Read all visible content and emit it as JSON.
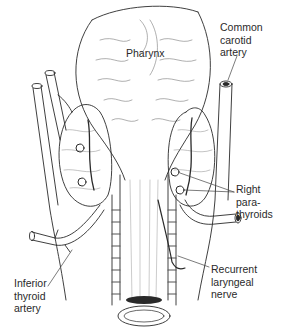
{
  "figure": {
    "colors": {
      "line": "#2a2a2a",
      "shade": "#8a8a8a",
      "background": "#ffffff"
    }
  },
  "labels": {
    "pharynx": {
      "lines": [
        "Pharynx"
      ]
    },
    "common_carotid_artery": {
      "lines": [
        "Common",
        "carotid",
        "artery"
      ]
    },
    "right_parathyroids": {
      "lines": [
        "Right",
        "para-",
        "thyroids"
      ]
    },
    "recurrent_laryngeal_nerve": {
      "lines": [
        "Recurrent",
        "laryngeal",
        "nerve"
      ]
    },
    "inferior_thyroid_artery": {
      "lines": [
        "Inferior",
        "thyroid",
        "artery"
      ]
    }
  }
}
